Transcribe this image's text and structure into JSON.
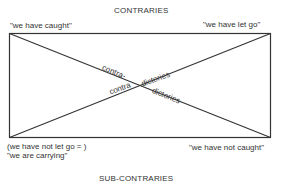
{
  "diagram": {
    "title_top": "CONTRARIES",
    "title_bottom": "SUB-CONTRARIES",
    "corners": {
      "top_left": "\"we have caught\"",
      "top_right": "\"we have let go\"",
      "bottom_left_line1": "(we have not let go = )",
      "bottom_left_line2": "\"we are carrying\"",
      "bottom_right": "\"we have not caught\""
    },
    "diagonals": {
      "upper_label_part1": "contra-",
      "upper_label_part2": "dictories",
      "lower_label_part1": "contradictories",
      "lower_label_part2": "dictories",
      "lower_label_left": "contra",
      "upper_label_right": "dictories"
    },
    "colors": {
      "line": "#333333",
      "text": "#333333",
      "background": "#ffffff"
    }
  }
}
